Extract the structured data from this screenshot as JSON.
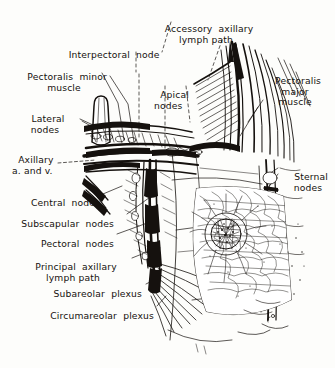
{
  "figure": {
    "style": "pen-and-ink anatomical line engraving",
    "background_color": "#fdfdfb",
    "ink_color": "#15110e",
    "artist_mark": "sc"
  },
  "labels": [
    {
      "id": "accessory-axillary-lymph-path",
      "line1": "Accessory  axillary",
      "line2": "lymph path",
      "align": "center"
    },
    {
      "id": "interpectoral-node",
      "line1": "Interpectoral  node",
      "line2": "",
      "align": "center"
    },
    {
      "id": "pectoralis-minor-muscle",
      "line1": "Pectoralis  minor",
      "line2": "muscle",
      "align": "center"
    },
    {
      "id": "apical-nodes",
      "line1": "Apical",
      "line2": "nodes",
      "align": "left"
    },
    {
      "id": "pectoralis-major-muscle",
      "line1": "Pectoralis",
      "line2": "major",
      "line3": "muscle",
      "align": "center"
    },
    {
      "id": "lateral-nodes",
      "line1": "Lateral",
      "line2": "nodes",
      "align": "center"
    },
    {
      "id": "axillary-artery-and-vein",
      "line1": "Axillary",
      "line2": "a. and v.",
      "align": "left"
    },
    {
      "id": "sternal-nodes",
      "line1": "Sternal",
      "line2": "nodes",
      "align": "center"
    },
    {
      "id": "central-nodes",
      "line1": "Central  nodes",
      "line2": "",
      "align": "right"
    },
    {
      "id": "subscapular-nodes",
      "line1": "Subscapular  nodes",
      "line2": "",
      "align": "right"
    },
    {
      "id": "pectoral-nodes",
      "line1": "Pectoral  nodes",
      "line2": "",
      "align": "right"
    },
    {
      "id": "principal-axillary-lymph-path",
      "line1": "Principal  axillary",
      "line2": "lymph path",
      "align": "center"
    },
    {
      "id": "subareolar-plexus",
      "line1": "Subareolar  plexus",
      "line2": "",
      "align": "right"
    },
    {
      "id": "circumareolar-plexus",
      "line1": "Circumareolar  plexus",
      "line2": "",
      "align": "right"
    }
  ]
}
